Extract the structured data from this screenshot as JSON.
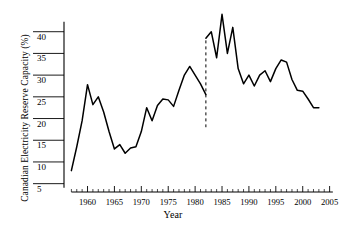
{
  "chart_data": {
    "type": "line",
    "title": "",
    "xlabel": "Year",
    "ylabel": "Canadian Electricity Reserve Capacity (%)",
    "xlim": [
      1956,
      2006
    ],
    "ylim": [
      4,
      45
    ],
    "grid": false,
    "legend": null,
    "x_ticks_major": [
      1960,
      1965,
      1970,
      1975,
      1980,
      1985,
      1990,
      1995,
      2000,
      2005
    ],
    "x_tick_labels": [
      "1960",
      "1965",
      "1970",
      "1975",
      "1980",
      "1985",
      "1990",
      "1995",
      "2000",
      "2005"
    ],
    "x_minor_tick_step": 1,
    "y_ticks": [
      5,
      10,
      15,
      20,
      25,
      30,
      35,
      40
    ],
    "y_tick_labels": [
      "5",
      "10",
      "15",
      "20",
      "25",
      "30",
      "35",
      "40"
    ],
    "series": [
      {
        "name": "Canadian Electricity Reserve Capacity",
        "x": [
          1957,
          1958,
          1959,
          1960,
          1961,
          1962,
          1963,
          1964,
          1965,
          1966,
          1967,
          1968,
          1969,
          1970,
          1971,
          1972,
          1973,
          1974,
          1975,
          1976,
          1977,
          1978,
          1979,
          1980,
          1981,
          1982
        ],
        "values": [
          8.0,
          13.5,
          19.5,
          27.8,
          23.2,
          25.0,
          21.5,
          17.0,
          13.0,
          14.0,
          12.0,
          13.2,
          13.5,
          17.0,
          22.5,
          19.5,
          23.0,
          24.5,
          24.3,
          22.8,
          26.5,
          30.0,
          32.0,
          30.0,
          28.0,
          25.5
        ]
      },
      {
        "name": "Canadian Electricity Reserve Capacity (post-1982)",
        "x": [
          1982,
          1983,
          1984,
          1985,
          1986,
          1987,
          1988,
          1989,
          1990,
          1991,
          1992,
          1993,
          1994,
          1995,
          1996,
          1997,
          1998,
          1999,
          2000,
          2001,
          2002,
          2003
        ],
        "values": [
          38.5,
          40.0,
          34.0,
          44.0,
          35.0,
          41.0,
          31.5,
          28.0,
          30.0,
          27.5,
          30.0,
          31.0,
          28.5,
          31.5,
          33.5,
          33.0,
          29.0,
          26.5,
          26.3,
          24.5,
          22.5,
          22.5
        ]
      }
    ],
    "annotations": [
      {
        "type": "vertical-dashed-line",
        "x": 1982,
        "y_start": 38.0,
        "y_end": 18.0,
        "label": ""
      }
    ],
    "colors": {
      "line": "#000000",
      "axis": "#000000",
      "background": "#ffffff"
    }
  }
}
